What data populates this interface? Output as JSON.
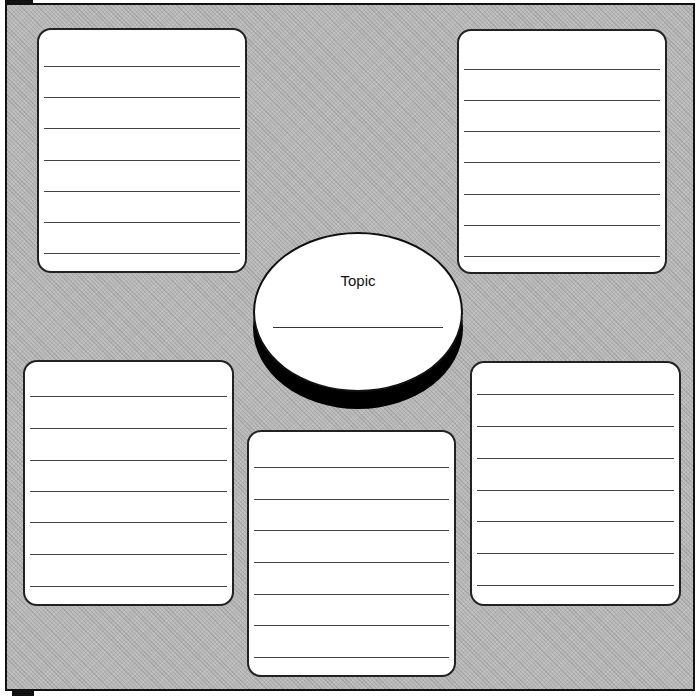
{
  "diagram": {
    "type": "graphic-organizer",
    "center": {
      "label": "Topic",
      "lines": 1
    },
    "boxes": [
      {
        "id": "top-left",
        "lines": 7
      },
      {
        "id": "top-right",
        "lines": 7
      },
      {
        "id": "bottom-left",
        "lines": 7
      },
      {
        "id": "bottom-center",
        "lines": 7
      },
      {
        "id": "bottom-right",
        "lines": 7
      }
    ],
    "colors": {
      "background_pattern": "#b8b8b8",
      "box_fill": "#ffffff",
      "border": "#111111"
    }
  }
}
